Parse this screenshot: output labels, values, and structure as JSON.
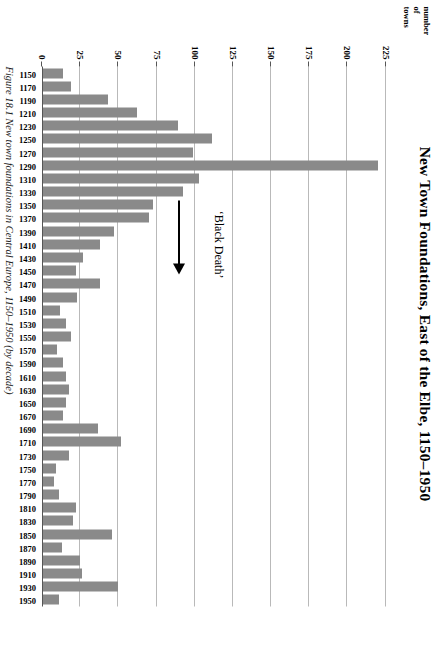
{
  "chart_data": {
    "type": "bar",
    "title": "New Town Foundations, East of the Elbe, 1150–1950",
    "xlabel": "",
    "ylabel": "number of towns",
    "ylabel_lines": [
      "number",
      "of",
      "towns"
    ],
    "orientation": "vertical-rotated",
    "grid": true,
    "legend": null,
    "ylim": [
      0,
      237
    ],
    "yticks": [
      0,
      25,
      50,
      75,
      100,
      125,
      150,
      175,
      200,
      225
    ],
    "ytick_labels": [
      "0",
      "25",
      "50",
      "75",
      "100",
      "125",
      "150",
      "175",
      "200",
      "225"
    ],
    "categories": [
      "1150",
      "1170",
      "1190",
      "1210",
      "1230",
      "1250",
      "1270",
      "1290",
      "1310",
      "1330",
      "1350",
      "1370",
      "1390",
      "1410",
      "1430",
      "1450",
      "1470",
      "1490",
      "1510",
      "1530",
      "1550",
      "1570",
      "1590",
      "1610",
      "1630",
      "1650",
      "1670",
      "1690",
      "1710",
      "1730",
      "1750",
      "1770",
      "1790",
      "1810",
      "1830",
      "1850",
      "1870",
      "1890",
      "1910",
      "1930",
      "1950"
    ],
    "values": [
      14,
      19,
      43,
      62,
      89,
      111,
      99,
      220,
      103,
      92,
      73,
      70,
      47,
      38,
      27,
      22,
      38,
      23,
      12,
      16,
      19,
      10,
      14,
      16,
      18,
      16,
      14,
      37,
      52,
      18,
      9,
      8,
      11,
      22,
      20,
      46,
      13,
      25,
      26,
      50,
      11
    ],
    "annotations": [
      {
        "text": "‘Black Death’",
        "points_to_category": "1350"
      }
    ],
    "caption": "Figure 18.1  New town foundations in Central Europe, 1150–1950 (by decade)",
    "colors": {
      "bar": "#8a8a8a",
      "grid": "#b9b9b9",
      "axis": "#555555",
      "text": "#000000"
    }
  }
}
